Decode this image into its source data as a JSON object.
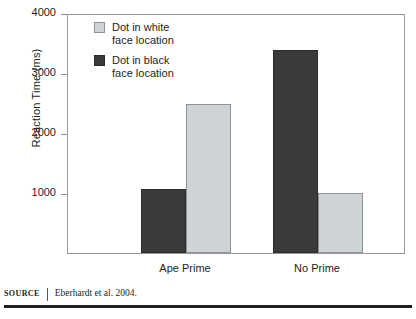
{
  "chart_data": {
    "type": "bar",
    "title": "",
    "subtitle": "",
    "xlabel": "",
    "ylabel": "Reaction Time (ms)",
    "ylim": [
      0,
      4000
    ],
    "yticks": [
      1000,
      2000,
      3000,
      4000
    ],
    "ytick_labels": [
      "1000",
      "2000",
      "3000",
      "4000"
    ],
    "grid": false,
    "legend_position": "top-left inside plot",
    "categories": [
      "Ape Prime",
      "No Prime"
    ],
    "series": [
      {
        "name": "Dot in black\nface location",
        "color": "#3a3a3a",
        "values": [
          1070,
          3390
        ]
      },
      {
        "name": "Dot in white\nface location",
        "color": "#ced3d5",
        "values": [
          2480,
          1000
        ]
      }
    ],
    "bar_order_within_group": [
      "Dot in black face location",
      "Dot in white face location"
    ],
    "annotations": []
  },
  "legend": {
    "items": [
      {
        "label": "Dot in white\nface location",
        "swatch": "light-swatch-icon",
        "color": "#ced3d5"
      },
      {
        "label": "Dot in black\nface location",
        "swatch": "dark-swatch-icon",
        "color": "#3a3a3a"
      }
    ]
  },
  "axes": {
    "y_title": "Reaction Time (ms)",
    "y_ticks": [
      "4000",
      "3000",
      "2000",
      "1000"
    ],
    "x_ticks": [
      "Ape Prime",
      "No Prime"
    ]
  },
  "source": {
    "kicker": "SOURCE",
    "text": "Eberhardt et al. 2004."
  },
  "colors": {
    "dark_bar": "#3a3a3a",
    "light_bar": "#ced3d5",
    "frame": "#9a9a9a",
    "text": "#231f20",
    "rule": "#231f20"
  }
}
